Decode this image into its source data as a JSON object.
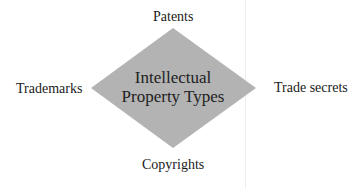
{
  "diagram": {
    "center": {
      "line1": "Intellectual",
      "line2": "Property Types"
    },
    "top": "Patents",
    "left": "Trademarks",
    "right": "Trade secrets",
    "bottom": "Copyrights",
    "colors": {
      "diamond_fill": "#b3b3b3",
      "text": "#1a1a1a"
    }
  }
}
